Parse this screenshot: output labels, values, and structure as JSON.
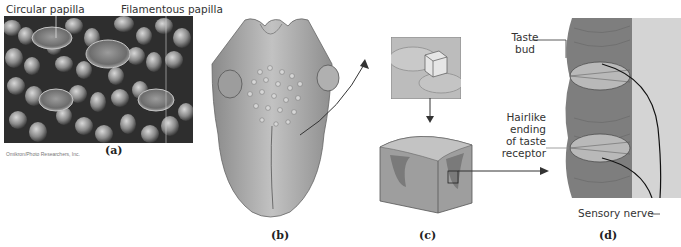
{
  "figure": {
    "panels": [
      {
        "id": "a",
        "label": "(a)",
        "description": "Scanning electron micrograph of tongue surface"
      },
      {
        "id": "b",
        "label": "(b)",
        "description": "Tongue dorsal view"
      },
      {
        "id": "c",
        "label": "(c)",
        "description": "Enlarged block of papilla tissue"
      },
      {
        "id": "d",
        "label": "(d)",
        "description": "Taste buds in cross-section"
      }
    ],
    "callouts": {
      "circular_papilla": "Circular papilla",
      "filamentous_papilla": "Filamentous papilla",
      "taste_bud_line1": "Taste",
      "taste_bud_line2": "bud",
      "hairlike_line1": "Hairlike",
      "hairlike_line2": "ending",
      "hairlike_line3": "of taste",
      "hairlike_line4": "receptor",
      "sensory_nerve": "Sensory nerve"
    },
    "credit": "Omikron/Photo Researchers, Inc.",
    "colors": {
      "micrograph_dark": "#3a3a3a",
      "tongue_fill": "#a9a9a9",
      "tissue_fill": "#8f8f8f",
      "line": "#333333"
    }
  }
}
